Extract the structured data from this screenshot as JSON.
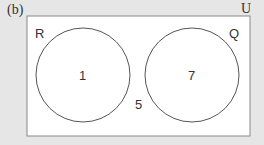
{
  "figure_label": "(b)",
  "universal_set": {
    "label": "U"
  },
  "sets": [
    {
      "label": "R",
      "count": "1"
    },
    {
      "label": "Q",
      "count": "7"
    }
  ],
  "outside_count": "5",
  "colors": {
    "background": "#e6e6e6",
    "rectangle_fill": "#ffffff",
    "stroke": "#555555",
    "text": "#333333"
  }
}
